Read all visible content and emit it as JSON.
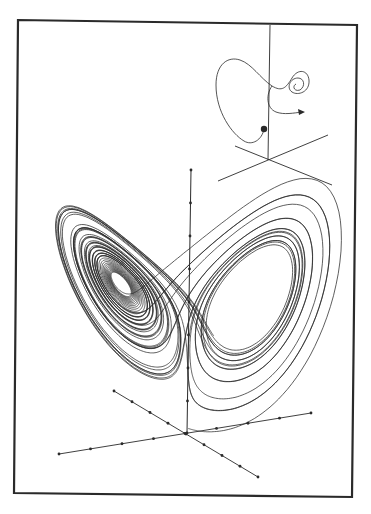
{
  "figure": {
    "background": "#ffffff",
    "ink": "#2a2a2a",
    "frame": {
      "corners": [
        [
          18,
          20
        ],
        [
          357,
          25
        ],
        [
          352,
          497
        ],
        [
          14,
          493
        ]
      ],
      "stroke_width": 2.2
    }
  },
  "inset": {
    "description": "single trajectory starting at a dot, ending in a spiral with an arrowhead",
    "vertical_axis": {
      "x1": 270,
      "y1": 25,
      "x2": 268,
      "y2": 160
    },
    "axes": [
      {
        "x1": 218,
        "y1": 181,
        "x2": 328,
        "y2": 135
      },
      {
        "x1": 235,
        "y1": 146,
        "x2": 332,
        "y2": 185
      }
    ],
    "start_dot": [
      264,
      129
    ],
    "arrow_tip": [
      305,
      112
    ]
  },
  "main_plot": {
    "attractor": "Lorenz",
    "parameters": {
      "sigma": 10,
      "rho": 28,
      "beta": 2.6667
    },
    "initial_state": [
      0.0,
      1.0,
      1.05
    ],
    "origin": [
      187,
      433
    ],
    "z_axis": {
      "top": [
        191,
        170
      ],
      "ticks_y": [
        170,
        203,
        236,
        269,
        302,
        335,
        368,
        401,
        433
      ]
    },
    "x_axis": {
      "from": [
        59,
        454
      ],
      "to": [
        311,
        413
      ],
      "ticks": 9
    },
    "y_axis": {
      "from": [
        114,
        391
      ],
      "to": [
        258,
        477
      ],
      "ticks": 9
    }
  }
}
